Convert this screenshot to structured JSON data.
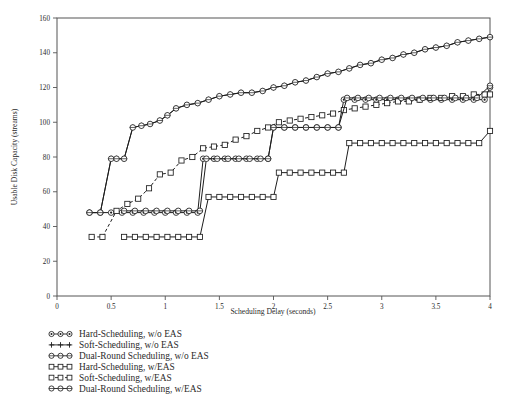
{
  "chart_data": {
    "type": "line",
    "title": "",
    "xlabel": "Scheduling Delay (seconds)",
    "ylabel": "Usable Disk Capacity (streams)",
    "xlim": [
      0,
      4
    ],
    "ylim": [
      0,
      160
    ],
    "xticks": [
      0,
      0.5,
      1,
      1.5,
      2,
      2.5,
      3,
      3.5,
      4
    ],
    "xtick_labels": [
      "0",
      "0.5",
      "1",
      "1.5",
      "2",
      "2.5",
      "3",
      "3.5",
      "4"
    ],
    "yticks": [
      0,
      20,
      40,
      60,
      80,
      100,
      120,
      140,
      160
    ],
    "ytick_labels": [
      "0",
      "20",
      "40",
      "60",
      "80",
      "100",
      "120",
      "140",
      "160"
    ],
    "grid": false,
    "legend_position": "below-left",
    "series": [
      {
        "name": "Hard-Scheduling, w/o EAS",
        "marker": "circle-dot",
        "linestyle": "solid",
        "x": [
          0.3,
          0.4,
          0.5,
          0.6,
          0.7,
          0.8,
          0.9,
          1.0,
          1.1,
          1.2,
          1.3,
          1.35,
          1.45,
          1.55,
          1.65,
          1.75,
          1.85,
          1.95,
          2.0,
          2.1,
          2.2,
          2.3,
          2.4,
          2.5,
          2.6,
          2.65,
          2.75,
          2.85,
          2.95,
          3.05,
          3.15,
          3.25,
          3.35,
          3.45,
          3.55,
          3.65,
          3.75,
          3.85,
          3.95,
          4.0
        ],
        "y": [
          48,
          48,
          48,
          48,
          48,
          48,
          48,
          48,
          48,
          48,
          48,
          79,
          79,
          79,
          79,
          79,
          79,
          79,
          97,
          97,
          97,
          97,
          97,
          97,
          97,
          113,
          113,
          113,
          113,
          113,
          113,
          113,
          113,
          113,
          113,
          113,
          113,
          113,
          113,
          120
        ]
      },
      {
        "name": "Soft-Scheduling, w/o EAS",
        "marker": "plus-cross",
        "linestyle": "solid",
        "x": [
          0.3,
          0.4,
          0.5,
          0.55,
          0.62,
          0.7,
          0.78,
          0.86,
          0.95,
          1.02,
          1.1,
          1.2,
          1.3,
          1.4,
          1.5,
          1.6,
          1.7,
          1.8,
          1.9,
          2.0,
          2.1,
          2.2,
          2.3,
          2.4,
          2.5,
          2.6,
          2.7,
          2.8,
          2.9,
          3.0,
          3.1,
          3.2,
          3.3,
          3.4,
          3.5,
          3.6,
          3.7,
          3.8,
          3.9,
          4.0
        ],
        "y": [
          48,
          48,
          79,
          79,
          79,
          97,
          98,
          99,
          101,
          104,
          108,
          110,
          111,
          113,
          115,
          116,
          117,
          117,
          118,
          120,
          121,
          123,
          124,
          126,
          128,
          129,
          131,
          133,
          134,
          136,
          137,
          139,
          140,
          142,
          143,
          144,
          146,
          147,
          148,
          149
        ]
      },
      {
        "name": "Dual-Round Scheduling, w/o EAS",
        "marker": "circle",
        "linestyle": "solid",
        "x": [
          0.3,
          0.4,
          0.5,
          0.55,
          0.62,
          0.7,
          0.78,
          0.86,
          0.95,
          1.02,
          1.1,
          1.2,
          1.3,
          1.4,
          1.5,
          1.6,
          1.7,
          1.8,
          1.9,
          2.0,
          2.1,
          2.2,
          2.3,
          2.4,
          2.5,
          2.6,
          2.7,
          2.8,
          2.9,
          3.0,
          3.1,
          3.2,
          3.3,
          3.4,
          3.5,
          3.6,
          3.7,
          3.8,
          3.9,
          4.0
        ],
        "y": [
          48,
          48,
          79,
          79,
          79,
          97,
          98,
          99,
          101,
          104,
          108,
          110,
          111,
          113,
          115,
          116,
          117,
          117,
          118,
          120,
          121,
          123,
          124,
          126,
          128,
          129,
          131,
          133,
          134,
          136,
          137,
          139,
          140,
          142,
          143,
          144,
          146,
          147,
          148,
          149
        ]
      },
      {
        "name": "Hard-Scheduling, w/EAS",
        "marker": "square",
        "linestyle": "solid",
        "x": [
          0.62,
          0.72,
          0.82,
          0.92,
          1.02,
          1.12,
          1.22,
          1.32,
          1.4,
          1.5,
          1.6,
          1.7,
          1.8,
          1.9,
          2.0,
          2.05,
          2.15,
          2.25,
          2.35,
          2.45,
          2.55,
          2.65,
          2.7,
          2.8,
          2.9,
          3.0,
          3.1,
          3.2,
          3.3,
          3.4,
          3.5,
          3.6,
          3.7,
          3.8,
          3.9,
          4.0
        ],
        "y": [
          34,
          34,
          34,
          34,
          34,
          34,
          34,
          34,
          57,
          57,
          57,
          57,
          57,
          57,
          57,
          71,
          71,
          71,
          71,
          71,
          71,
          71,
          88,
          88,
          88,
          88,
          88,
          88,
          88,
          88,
          88,
          88,
          88,
          88,
          88,
          95
        ]
      },
      {
        "name": "Soft-Scheduling, w/EAS",
        "marker": "square-dash",
        "linestyle": "dashed",
        "x": [
          0.32,
          0.42,
          0.55,
          0.65,
          0.75,
          0.85,
          0.95,
          1.05,
          1.15,
          1.25,
          1.35,
          1.45,
          1.55,
          1.65,
          1.75,
          1.85,
          1.95,
          2.05,
          2.15,
          2.25,
          2.35,
          2.45,
          2.55,
          2.65,
          2.75,
          2.85,
          2.95,
          3.05,
          3.15,
          3.25,
          3.35,
          3.45,
          3.55,
          3.65,
          3.75,
          3.85,
          3.95,
          4.0
        ],
        "y": [
          34,
          34,
          49,
          53,
          56,
          62,
          70,
          71,
          78,
          80,
          85,
          86,
          87,
          90,
          92,
          95,
          97,
          100,
          101,
          102,
          103,
          104,
          105,
          107,
          108,
          109,
          110,
          111,
          112,
          112,
          113,
          114,
          114,
          115,
          115,
          116,
          116,
          116
        ]
      },
      {
        "name": "Dual-Round Scheduling, w/EAS",
        "marker": "circle-dash",
        "linestyle": "solid",
        "x": [
          0.62,
          0.72,
          0.82,
          0.92,
          1.02,
          1.12,
          1.22,
          1.32,
          1.38,
          1.48,
          1.58,
          1.68,
          1.78,
          1.88,
          1.95,
          2.0,
          2.1,
          2.2,
          2.3,
          2.4,
          2.5,
          2.6,
          2.68,
          2.78,
          2.88,
          2.98,
          3.08,
          3.18,
          3.28,
          3.38,
          3.48,
          3.58,
          3.68,
          3.78,
          3.88,
          4.0
        ],
        "y": [
          49,
          49,
          49,
          49,
          49,
          49,
          49,
          49,
          79,
          79,
          79,
          79,
          79,
          79,
          79,
          97,
          97,
          97,
          97,
          97,
          97,
          97,
          114,
          114,
          114,
          114,
          114,
          114,
          114,
          114,
          114,
          114,
          114,
          114,
          114,
          121
        ]
      }
    ]
  },
  "legend": {
    "items": [
      {
        "label": "Hard-Scheduling, w/o EAS",
        "marker": "circle-dot",
        "linestyle": "solid"
      },
      {
        "label": "Soft-Scheduling, w/o EAS",
        "marker": "plus-cross",
        "linestyle": "solid"
      },
      {
        "label": "Dual-Round Scheduling, w/o EAS",
        "marker": "circle",
        "linestyle": "solid"
      },
      {
        "label": "Hard-Scheduling, w/EAS",
        "marker": "square",
        "linestyle": "solid"
      },
      {
        "label": "Soft-Scheduling, w/EAS",
        "marker": "square-dash",
        "linestyle": "dashed"
      },
      {
        "label": "Dual-Round Scheduling, w/EAS",
        "marker": "circle-dash",
        "linestyle": "solid"
      }
    ]
  }
}
